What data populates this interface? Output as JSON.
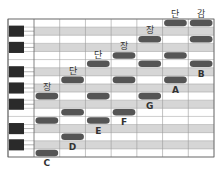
{
  "diagram": {
    "type": "piano-roll",
    "pitch_rows": [
      "C",
      "C#",
      "D",
      "D#",
      "E",
      "F",
      "F#",
      "G",
      "G#",
      "A",
      "A#",
      "B",
      "C2",
      "C#2",
      "D2",
      "D#2",
      "E2"
    ],
    "black_key_rows": [
      1,
      3,
      6,
      8,
      10,
      13,
      15
    ],
    "columns": 7,
    "colors": {
      "note": "#555555",
      "black_key": "#2a2a2a",
      "black_row": "#d6d6d6",
      "white_row": "#ffffff",
      "grid": "#9a9a9a",
      "label": "#333333"
    },
    "chords": [
      {
        "root_label": "C",
        "quality_label": "장",
        "notes": [
          0,
          4,
          7
        ]
      },
      {
        "root_label": "D",
        "quality_label": "단",
        "notes": [
          2,
          5,
          9
        ]
      },
      {
        "root_label": "E",
        "quality_label": "단",
        "notes": [
          4,
          7,
          11
        ]
      },
      {
        "root_label": "F",
        "quality_label": "장",
        "notes": [
          5,
          9,
          12
        ]
      },
      {
        "root_label": "G",
        "quality_label": "장",
        "notes": [
          7,
          11,
          14
        ]
      },
      {
        "root_label": "A",
        "quality_label": "단",
        "notes": [
          9,
          12,
          16
        ]
      },
      {
        "root_label": "B",
        "quality_label": "감",
        "notes": [
          11,
          14,
          17
        ]
      }
    ]
  }
}
